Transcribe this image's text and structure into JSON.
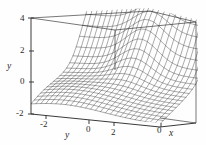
{
  "figure": {
    "background_color": "#fefefe",
    "line_color": "#222222",
    "box_color": "#4a4a4a"
  },
  "chart_data": {
    "type": "line",
    "title": "",
    "subtitle": "",
    "plot_kind": "3d-wireframe-surface",
    "xlabel": "x",
    "ylabel": "y",
    "zlabel": "y",
    "grid": false,
    "legend": "none",
    "vertical_axis": {
      "label": "y",
      "ticks": [
        4,
        2,
        0,
        -2
      ],
      "tick_labels": [
        "4",
        "2",
        "0",
        "-2"
      ],
      "range": [
        -2,
        4
      ]
    },
    "depth_axis": {
      "label": "y",
      "ticks": [
        -2,
        0,
        2
      ],
      "tick_labels": [
        "-2",
        "0",
        "2"
      ],
      "range": [
        -2,
        2
      ]
    },
    "horizontal_axis": {
      "label": "x",
      "ticks": [
        0
      ],
      "tick_labels": [
        "0"
      ],
      "range": [
        -2,
        2
      ]
    },
    "surface_description": "wireframe mesh surface with a central rounded peak, a broad shoulder on the left falling to the base plane, and a steep wall rising to the top of the box on the right",
    "mesh_rows": 26,
    "mesh_cols": 26,
    "annotations": []
  },
  "labels": {
    "vertical": {
      "t4": "4",
      "t2": "2",
      "t0": "0",
      "tm2": "-2",
      "axis": "y"
    },
    "depth": {
      "tm2": "-2",
      "t0": "0",
      "t2": "2",
      "axis": "y"
    },
    "horizontal": {
      "t0": "0",
      "axis": "x"
    }
  }
}
